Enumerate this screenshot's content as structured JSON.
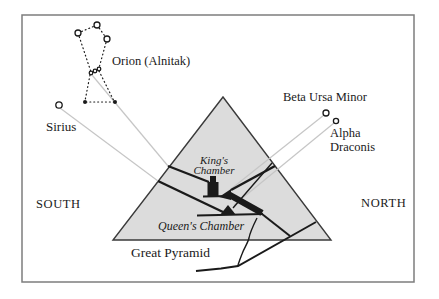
{
  "figure": {
    "stars": {
      "orion_label": "Orion (Alnitak)",
      "sirius_label": "Sirius",
      "beta_ursa_minor_label": "Beta Ursa Minor",
      "alpha_draconis_line1": "Alpha",
      "alpha_draconis_line2": "Draconis"
    },
    "pyramid": {
      "name_label": "Great Pyramid",
      "kings_chamber_line1": "King's",
      "kings_chamber_line2": "Chamber",
      "queens_chamber_label": "Queen's Chamber"
    },
    "directions": {
      "south": "SOUTH",
      "north": "NORTH"
    },
    "colors": {
      "pyramid_fill": "#dcdcdc",
      "pyramid_stroke": "#3a3a3a",
      "sight_line": "#c6c6c6",
      "ink": "#1a1a1a",
      "frame": "#7d7d7d"
    }
  }
}
